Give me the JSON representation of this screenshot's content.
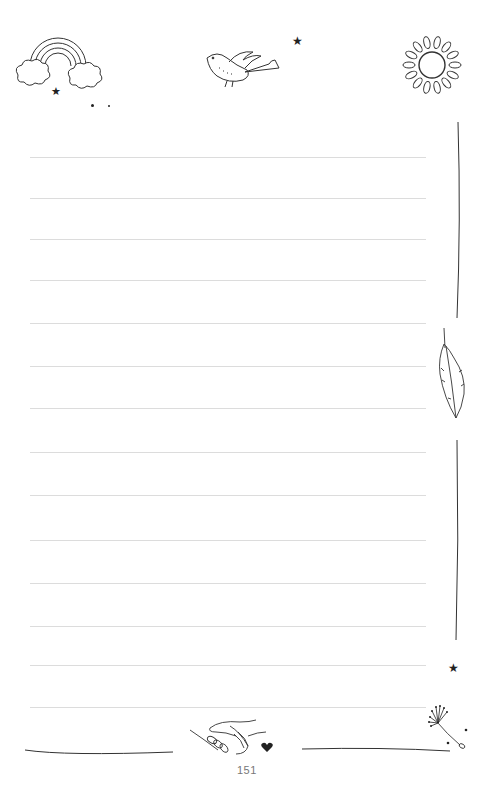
{
  "page": {
    "type": "lined-journal-page",
    "page_number": "151",
    "line_count": 14,
    "line_color": "#dcdcdc",
    "ink_color": "#222222"
  },
  "rules": [
    {
      "y": 157
    },
    {
      "y": 198
    },
    {
      "y": 239
    },
    {
      "y": 280
    },
    {
      "y": 323
    },
    {
      "y": 366
    },
    {
      "y": 408
    },
    {
      "y": 452
    },
    {
      "y": 495
    },
    {
      "y": 540
    },
    {
      "y": 583
    },
    {
      "y": 626
    },
    {
      "y": 665
    },
    {
      "y": 707
    }
  ],
  "decorations": {
    "top": [
      "rainbow-with-clouds",
      "bird",
      "star",
      "sun"
    ],
    "right": [
      "vertical-line",
      "feather",
      "vertical-line",
      "star",
      "dandelion-seed"
    ],
    "bottom": [
      "left-bottom-line",
      "holding-hands",
      "heart",
      "right-bottom-line"
    ]
  }
}
